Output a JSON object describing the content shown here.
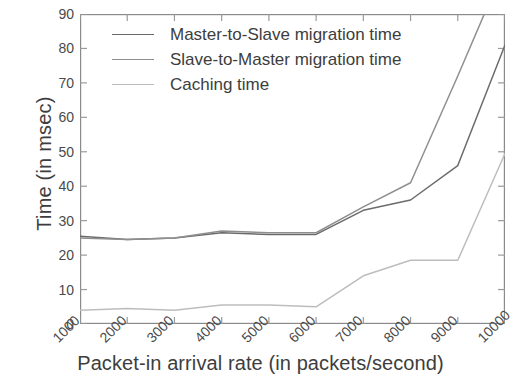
{
  "chart_data": {
    "type": "line",
    "title": "",
    "xlabel": "Packet-in arrival rate (in packets/second)",
    "ylabel": "Time (in msec)",
    "x": [
      1000,
      2000,
      3000,
      4000,
      5000,
      6000,
      7000,
      8000,
      9000,
      10000
    ],
    "xtick_labels": [
      "1000",
      "2000",
      "3000",
      "4000",
      "5000",
      "6000",
      "7000",
      "8000",
      "9000",
      "10000"
    ],
    "ytick_labels": [
      "0",
      "10",
      "20",
      "30",
      "40",
      "50",
      "60",
      "70",
      "80",
      "90"
    ],
    "xlim": [
      1000,
      10000
    ],
    "ylim": [
      0,
      90
    ],
    "grid": false,
    "legend_position": "top-left",
    "series": [
      {
        "name": "Master-to-Slave migration time",
        "color": "#6b6b6b",
        "dash": "none",
        "values": [
          25.5,
          24.5,
          25.0,
          26.5,
          26.0,
          26.0,
          33.0,
          36.0,
          46.0,
          81.0
        ]
      },
      {
        "name": "Slave-to-Master migration time",
        "color": "#8f8f8f",
        "dash": "none",
        "values": [
          25.0,
          24.5,
          25.0,
          27.0,
          26.5,
          26.5,
          34.0,
          41.0,
          72.0,
          104.0
        ]
      },
      {
        "name": "Caching time",
        "color": "#bdbdbd",
        "dash": "none",
        "values": [
          4.0,
          4.5,
          4.0,
          5.5,
          5.5,
          5.0,
          14.0,
          18.5,
          18.5,
          49.5
        ]
      }
    ]
  },
  "axes": {
    "frame_color": "#8a8a8a",
    "tick_color": "#9a9a9a"
  }
}
